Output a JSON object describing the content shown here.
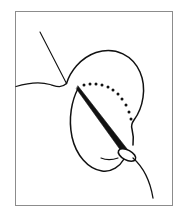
{
  "figure": {
    "title": "Surgical needle and suture passing through tissue",
    "type": "line-art-illustration",
    "background_color": "#ffffff",
    "ink_color": "#111111",
    "frame_color": "#8c8c8c",
    "canvas": {
      "width": 181,
      "height": 218
    },
    "frame": {
      "x": 15,
      "y": 11,
      "width": 157,
      "height": 194,
      "stroke_width": 1
    },
    "elements": {
      "suture_thread_upper": {
        "name": "suture-thread-upper",
        "description": "Thin straight suture strand descending from upper left toward the tissue junction",
        "path": "M 40 32 L 66.5 83.5",
        "stroke_width": 1.1
      },
      "skin_contour_left": {
        "name": "skin-contour-left",
        "description": "Wavy skin surface line running from the left frame edge to the tissue junction",
        "path": "M 16 86.5 C 26 83.5, 40 81.5, 50 84.5 C 57 86.6, 61 88.5, 66.5 83.5",
        "stroke_width": 1.3
      },
      "tissue_dome_outline": {
        "name": "tissue-dome-outline",
        "description": "Rounded tissue mass outline, dome at top with a notch on the lower right and a rounded base",
        "path": "M 66.5 83.5 C 70 72, 80 58, 96 52.5 C 116 46, 133 56, 140 72 C 147 88, 143 108, 134 120 C 131.5 123.5, 131 126, 132 129 C 133 133, 134 138, 133 145",
        "stroke_width": 1.5
      },
      "tissue_base_outline": {
        "name": "tissue-base-outline",
        "description": "Lower boundary of the tissue mass sweeping from the needle entry point down and around to the needle eye",
        "path": "M 78 88.5 C 72 100, 68 118, 72 137 C 76 155, 88 169, 102 171 C 112 172.5, 120 166, 124 159",
        "stroke_width": 1.5
      },
      "needle_path_dots": {
        "name": "needle-path-dots",
        "description": "Dotted arc indicating the intended curved trajectory of the needle inside the tissue",
        "count": 11,
        "dot_radius": 1.5,
        "points": [
          [
            84,
            85
          ],
          [
            90,
            84
          ],
          [
            96,
            84
          ],
          [
            102,
            85
          ],
          [
            108,
            87
          ],
          [
            113,
            90
          ],
          [
            118,
            94
          ],
          [
            122,
            99
          ],
          [
            126,
            105
          ],
          [
            129,
            112
          ],
          [
            131,
            119
          ]
        ]
      },
      "needle_shaft": {
        "name": "needle-shaft",
        "description": "Solid black tapered needle shaft running from the sharp tip at upper left to the wider swage end at lower right",
        "tip": [
          78,
          87
        ],
        "swage": [
          126,
          152
        ],
        "outline": "M 78.0 86.0 L 127.5 149.5 L 124.0 155.0 L 76.5 89.0 Z"
      },
      "needle_eye": {
        "name": "needle-eye",
        "description": "Oval swage/eye of the needle where the suture is attached",
        "center": [
          127,
          155
        ],
        "rx": 9.5,
        "ry": 5.0,
        "rotation_deg": 28,
        "stroke_width": 1.6
      },
      "suture_thread_lower": {
        "name": "suture-thread-lower",
        "description": "Suture strand emerging from the needle eye and curving down toward the lower right frame edge",
        "path": "M 133 158 C 142 166, 150 180, 153 198",
        "stroke_width": 1.3
      },
      "suture_thread_tail_left": {
        "name": "suture-thread-tail-left",
        "description": "Short suture tail continuing left from the needle eye along the tissue base",
        "path": "M 118 158 C 112 160, 106 160, 101 158",
        "stroke_width": 1.2
      }
    }
  }
}
